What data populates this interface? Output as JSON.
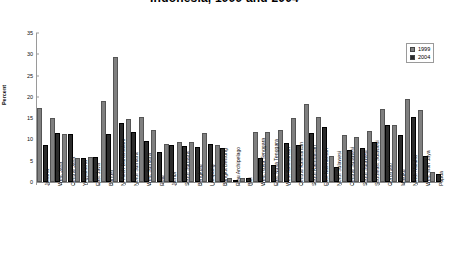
{
  "chart_data": {
    "type": "bar",
    "title": "Indonesia, 1999 and 2004",
    "xlabel": "",
    "ylabel": "Percent",
    "ylim": [
      0,
      35
    ],
    "yticks": [
      0,
      5,
      10,
      15,
      20,
      25,
      30,
      35
    ],
    "grid": false,
    "legend_position": "top-right",
    "categories": [
      "Jakarta",
      "West Java",
      "Central Java",
      "Yogyakarta",
      "East Java",
      "Banten",
      "N. Aceh Darussalam",
      "North Sumatra",
      "West Sumatra",
      "Riau",
      "Jambi",
      "South Sumatra",
      "Bengkulu",
      "Lampung",
      "Bangka Belitung",
      "Riau Archipelago",
      "Bali",
      "West Nusa Tenggara",
      "East Nusa Tenggara",
      "West Kalimantan",
      "Central Kalimantan",
      "South Kalimantan",
      "East Kalimantan",
      "North Sulawesi",
      "Central Sulawesi",
      "South Sulawesi",
      "Southeast Sulawesi",
      "Gorontalo",
      "Maluku",
      "North Maluku",
      "West Irian Jaya",
      "Papua"
    ],
    "series": [
      {
        "name": "1999",
        "color": "#7f7f7f",
        "values": [
          17.5,
          15.1,
          11.2,
          5.7,
          5.9,
          19.0,
          29.4,
          14.9,
          15.3,
          12.3,
          9.0,
          9.3,
          9.5,
          11.5,
          8.6,
          0.9,
          1.0,
          11.8,
          11.7,
          12.2,
          15.0,
          18.3,
          15.2,
          6.0,
          11.0,
          10.5,
          12.0,
          17.2,
          13.3,
          19.4,
          16.9,
          2.4
        ]
      },
      {
        "name": "2004",
        "color": "#2b2b2b",
        "values": [
          8.7,
          11.6,
          11.3,
          5.6,
          5.9,
          11.2,
          13.8,
          11.7,
          9.6,
          7.1,
          8.7,
          8.5,
          8.3,
          8.9,
          8.0,
          0.0,
          0.9,
          5.7,
          4.0,
          9.2,
          8.8,
          11.6,
          13.0,
          3.6,
          7.5,
          7.9,
          9.3,
          13.4,
          11.0,
          15.2,
          6.1,
          2.0
        ]
      }
    ]
  },
  "legend": {
    "items": [
      {
        "label": "1999"
      },
      {
        "label": "2004"
      }
    ]
  }
}
